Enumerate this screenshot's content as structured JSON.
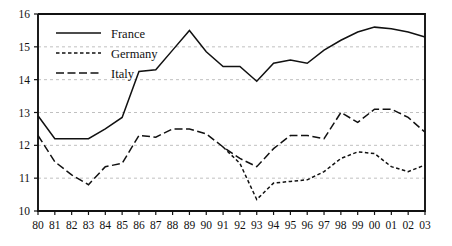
{
  "chart_data": {
    "type": "line",
    "title": "",
    "subtitle": "",
    "xlabel": "",
    "ylabel": "",
    "xlim": [
      1980,
      2003
    ],
    "ylim": [
      10,
      16
    ],
    "yticks": [
      10,
      11,
      12,
      13,
      14,
      15,
      16
    ],
    "ytick_labels": [
      "10",
      "11",
      "12",
      "13",
      "14",
      "15",
      "16"
    ],
    "grid": "horizontal-dashed",
    "legend_position": "top-left-inside",
    "x": [
      1980,
      1981,
      1982,
      1983,
      1984,
      1985,
      1986,
      1987,
      1988,
      1989,
      1990,
      1991,
      1992,
      1993,
      1994,
      1995,
      1996,
      1997,
      1998,
      1999,
      2000,
      2001,
      2002,
      2003
    ],
    "xtick_labels": [
      "80",
      "81",
      "82",
      "83",
      "84",
      "85",
      "86",
      "87",
      "88",
      "89",
      "90",
      "91",
      "92",
      "93",
      "94",
      "95",
      "96",
      "97",
      "98",
      "99",
      "00",
      "01",
      "02",
      "03"
    ],
    "series": [
      {
        "name": "France",
        "style": "solid",
        "color": "#111111",
        "values": [
          12.9,
          12.2,
          12.2,
          12.2,
          12.5,
          12.85,
          14.25,
          14.3,
          14.9,
          15.5,
          14.85,
          14.4,
          14.4,
          13.95,
          14.5,
          14.6,
          14.5,
          14.9,
          15.2,
          15.45,
          15.6,
          15.55,
          15.45,
          15.3
        ]
      },
      {
        "name": "Germany",
        "style": "dotted",
        "color": "#111111",
        "values": [
          null,
          null,
          null,
          null,
          null,
          null,
          null,
          null,
          null,
          null,
          null,
          11.95,
          11.45,
          10.35,
          10.85,
          10.9,
          10.95,
          11.2,
          11.6,
          11.8,
          11.75,
          11.35,
          11.2,
          11.4
        ]
      },
      {
        "name": "Italy",
        "style": "dashed",
        "color": "#111111",
        "values": [
          12.3,
          11.5,
          11.1,
          10.8,
          11.35,
          11.45,
          12.3,
          12.25,
          12.5,
          12.5,
          12.35,
          11.95,
          11.6,
          11.35,
          11.9,
          12.3,
          12.3,
          12.2,
          13.0,
          12.7,
          13.1,
          13.1,
          12.85,
          12.4
        ]
      }
    ]
  },
  "legend": {
    "items": [
      {
        "label": "France",
        "style": "solid"
      },
      {
        "label": "Germany",
        "style": "dotted"
      },
      {
        "label": "Italy",
        "style": "dashed"
      }
    ]
  }
}
